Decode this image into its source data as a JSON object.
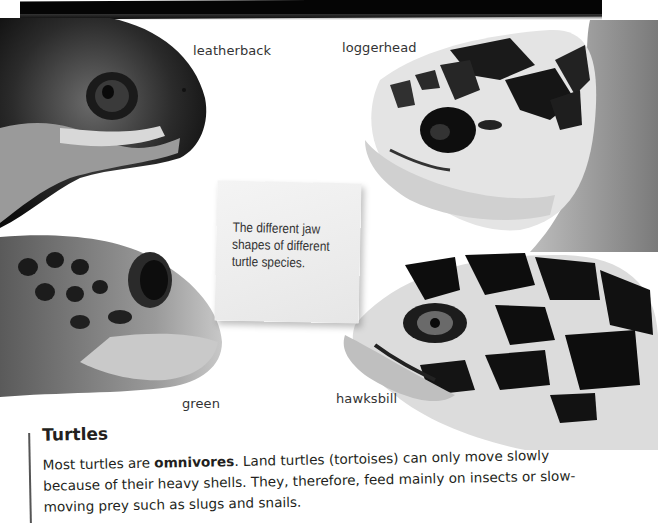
{
  "figure": {
    "labels": {
      "leatherback": "leatherback",
      "loggerhead": "loggerhead",
      "green": "green",
      "hawksbill": "hawksbill"
    },
    "caption": "The different jaw shapes of different turtle species."
  },
  "section": {
    "title": "Turtles",
    "body_pre": "Most turtles are ",
    "body_bold": "omnivores",
    "body_post": ". Land turtles (tortoises) can only move slowly because of their heavy shells. They, therefore, feed mainly on insects or slow-moving prey such as slugs and snails."
  },
  "colors": {
    "text": "#231f20",
    "note_bg": "#efefef",
    "bar": "#050505"
  }
}
